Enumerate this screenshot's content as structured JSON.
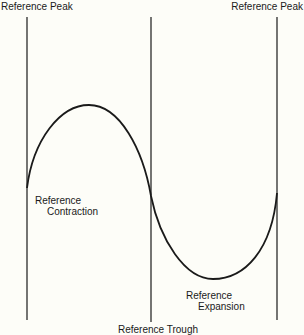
{
  "diagram": {
    "labels": {
      "peak_left": "Reference Peak",
      "peak_right": "Reference Peak",
      "contraction_line1": "Reference",
      "contraction_line2": "Contraction",
      "expansion_line1": "Reference",
      "expansion_line2": "Expansion",
      "trough": "Reference Trough"
    },
    "colors": {
      "background": "#fdfdf8",
      "line": "#1a1a1a"
    },
    "vertical_lines": [
      {
        "name": "reference-peak-left",
        "x": 27,
        "y1": 17,
        "y2": 320
      },
      {
        "name": "reference-trough",
        "x": 151,
        "y1": 17,
        "y2": 322
      },
      {
        "name": "reference-peak-right",
        "x": 277,
        "y1": 17,
        "y2": 320
      }
    ],
    "curve": {
      "description": "one full sine-like cycle: rises from left line to a peak, falls through the middle line to a trough, rises to the right line",
      "start": [
        27,
        188
      ],
      "peak": [
        89,
        105
      ],
      "mid_crossing": [
        151,
        196
      ],
      "trough": [
        213,
        279
      ],
      "end": [
        277,
        193
      ]
    }
  }
}
